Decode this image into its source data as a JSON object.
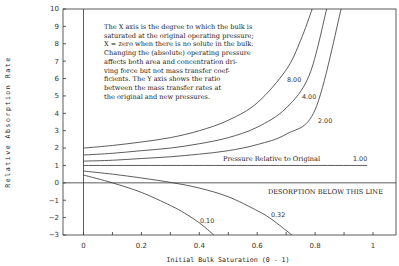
{
  "chart_data": {
    "type": "line",
    "title": "",
    "xlabel": "Initial Bulk Saturation (0 - 1)",
    "ylabel": "Relative Absorption Rate",
    "xlim": [
      -0.07,
      1.08
    ],
    "ylim": [
      -3,
      10
    ],
    "x_ticks": [
      "0",
      "0.2",
      "0.4",
      "0.6",
      "0.8",
      "1"
    ],
    "y_ticks": [
      "10",
      "9",
      "8",
      "7",
      "6",
      "5",
      "4",
      "3",
      "2",
      "1",
      "0",
      "-1",
      "-2",
      "-3"
    ],
    "grid": false,
    "legend": "inline curve labels",
    "annotation": {
      "lines": [
        "The X axis is the degree to which the bulk is",
        "saturated at the original operating pressure;",
        "X = zero when there is no solute in the bulk.",
        "Changing the (absolute) operating pressure",
        "affects both area and concentration dri-",
        "ving force but not mass transfer coef-",
        "ficients. The Y axis shows the ratio",
        "between the mass transfer rates at",
        "the original and new pressures."
      ],
      "pressure_label": "Pressure Relative to Original",
      "desorption_label": "DESORPTION BELOW THIS LINE"
    },
    "series": [
      {
        "name": "8.00",
        "x": [
          0,
          0.1,
          0.2,
          0.3,
          0.4,
          0.5,
          0.6,
          0.7,
          0.75,
          0.79
        ],
        "y": [
          2.0,
          2.15,
          2.35,
          2.6,
          3.0,
          3.6,
          4.6,
          6.5,
          8.2,
          10
        ]
      },
      {
        "name": "4.00",
        "x": [
          0,
          0.1,
          0.2,
          0.3,
          0.4,
          0.5,
          0.6,
          0.7,
          0.78,
          0.84
        ],
        "y": [
          1.6,
          1.7,
          1.85,
          2.0,
          2.25,
          2.6,
          3.2,
          4.3,
          6.2,
          10
        ]
      },
      {
        "name": "2.00",
        "x": [
          0,
          0.1,
          0.2,
          0.3,
          0.4,
          0.5,
          0.6,
          0.7,
          0.8,
          0.89
        ],
        "y": [
          1.25,
          1.3,
          1.4,
          1.5,
          1.65,
          1.85,
          2.2,
          2.8,
          4.2,
          10
        ]
      },
      {
        "name": "1.00",
        "x": [
          0,
          0.98
        ],
        "y": [
          1.0,
          1.0
        ]
      },
      {
        "name": "0.32",
        "x": [
          0,
          0.1,
          0.2,
          0.31,
          0.4,
          0.5,
          0.6,
          0.65,
          0.72
        ],
        "y": [
          0.68,
          0.5,
          0.28,
          0.0,
          -0.3,
          -0.8,
          -1.6,
          -2.1,
          -3.0
        ]
      },
      {
        "name": "0.10",
        "x": [
          0,
          0.1,
          0.2,
          0.3,
          0.35,
          0.4,
          0.45
        ],
        "y": [
          0.45,
          0.0,
          -0.55,
          -1.3,
          -1.75,
          -2.3,
          -3.0
        ]
      }
    ]
  }
}
